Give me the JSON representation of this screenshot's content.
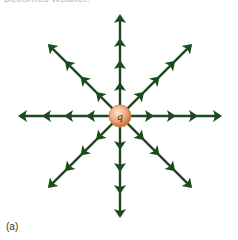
{
  "caption_top": "becomes weaker.",
  "panel_label": "(a)",
  "charge": {
    "label": "q",
    "center": [
      120,
      116
    ],
    "radius": 11,
    "color_light": "#f6c9a8",
    "color_dark": "#c97a4a"
  },
  "field_lines": {
    "count": 8,
    "direction": "outward",
    "arrow_color": "#1c4a1c",
    "arrow_distances": [
      30,
      52,
      74,
      98
    ],
    "angles_deg": [
      0,
      45,
      90,
      135,
      180,
      225,
      270,
      315
    ]
  }
}
